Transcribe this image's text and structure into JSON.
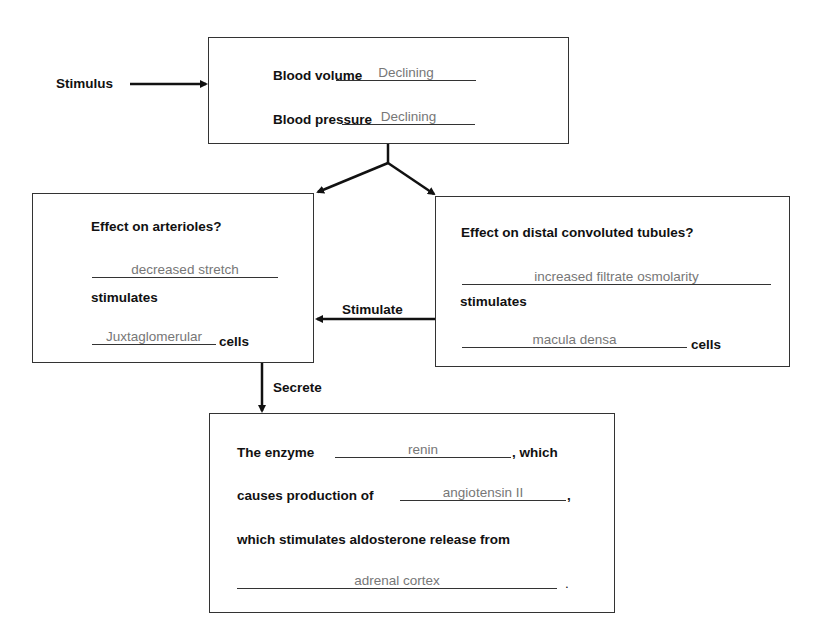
{
  "stimulus": {
    "label": "Stimulus"
  },
  "top_box": {
    "rows": [
      {
        "label": "Blood volume",
        "answer": "Declining"
      },
      {
        "label": "Blood pressure",
        "answer": "Declining"
      }
    ]
  },
  "left_box": {
    "title": "Effect on arterioles?",
    "answer1": "decreased stretch",
    "stimulates_label": "stimulates",
    "answer2": "Juxtaglomerular",
    "cells_label": "cells"
  },
  "right_box": {
    "title": "Effect on distal convoluted tubules?",
    "answer1": "increased filtrate osmolarity",
    "stimulates_label": "stimulates",
    "answer2": "macula densa",
    "cells_label": "cells"
  },
  "arrows": {
    "stimulate_label": "Stimulate",
    "secrete_label": "Secrete"
  },
  "bottom_box": {
    "line1_prefix": "The enzyme",
    "line1_answer": "renin",
    "line1_suffix": ", which",
    "line2_prefix": "causes production of",
    "line2_answer": "angiotensin II",
    "line2_suffix": ",",
    "line3": "which stimulates aldosterone release from",
    "line4_answer": "adrenal cortex",
    "line4_suffix": "."
  }
}
